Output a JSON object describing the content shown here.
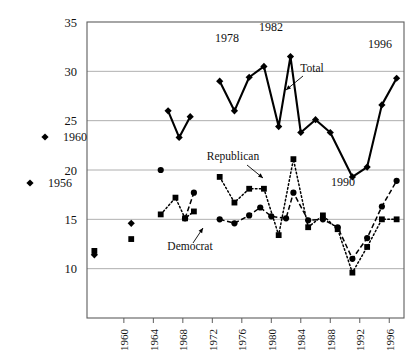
{
  "chart_data": {
    "type": "line",
    "title": "",
    "subtitle": "",
    "xlabel": "",
    "ylabel": "",
    "xlim": [
      1955,
      1998
    ],
    "ylim": [
      5,
      35
    ],
    "yticks": [
      5,
      10,
      15,
      20,
      25,
      30,
      35
    ],
    "ytick_labels": [
      "5",
      "10",
      "15",
      "20",
      "25",
      "30",
      "35"
    ],
    "xticks": [
      1960,
      1964,
      1968,
      1972,
      1976,
      1980,
      1984,
      1988,
      1992,
      1996
    ],
    "xtick_labels": [
      "1960",
      "1964",
      "1968",
      "1972",
      "1976",
      "1980",
      "1984",
      "1988",
      "1992",
      "1996"
    ],
    "grid": "horizontal",
    "legend": "inline-labels",
    "series": [
      {
        "name": "Total",
        "marker": "diamond",
        "linestyle": "solid",
        "points": [
          {
            "x": 1956,
            "y": 11.4
          },
          {
            "x": 1961,
            "y": 14.6
          },
          {
            "x": 1966,
            "y": 26.0
          },
          {
            "x": 1967.5,
            "y": 23.3
          },
          {
            "x": 1969,
            "y": 25.4
          },
          {
            "x": 1973,
            "y": 29.0
          },
          {
            "x": 1975,
            "y": 26.0
          },
          {
            "x": 1977,
            "y": 29.4
          },
          {
            "x": 1979,
            "y": 30.5
          },
          {
            "x": 1981,
            "y": 24.4
          },
          {
            "x": 1982.6,
            "y": 31.5
          },
          {
            "x": 1984,
            "y": 23.8
          },
          {
            "x": 1986,
            "y": 25.1
          },
          {
            "x": 1988,
            "y": 23.8
          },
          {
            "x": 1991,
            "y": 19.3
          },
          {
            "x": 1993,
            "y": 20.3
          },
          {
            "x": 1995,
            "y": 26.6
          },
          {
            "x": 1997,
            "y": 29.3
          }
        ]
      },
      {
        "name": "Republican",
        "marker": "square",
        "linestyle": "dotted",
        "points": [
          {
            "x": 1956,
            "y": 11.8
          },
          {
            "x": 1961,
            "y": 13.0
          },
          {
            "x": 1965,
            "y": 15.5
          },
          {
            "x": 1967,
            "y": 17.2
          },
          {
            "x": 1968.3,
            "y": 15.1
          },
          {
            "x": 1969.5,
            "y": 15.8
          },
          {
            "x": 1973,
            "y": 19.3
          },
          {
            "x": 1975,
            "y": 16.7
          },
          {
            "x": 1977,
            "y": 18.1
          },
          {
            "x": 1979,
            "y": 18.1
          },
          {
            "x": 1981,
            "y": 13.4
          },
          {
            "x": 1983,
            "y": 21.1
          },
          {
            "x": 1985,
            "y": 14.2
          },
          {
            "x": 1987,
            "y": 15.4
          },
          {
            "x": 1989,
            "y": 14.0
          },
          {
            "x": 1991,
            "y": 9.6
          },
          {
            "x": 1993,
            "y": 12.2
          },
          {
            "x": 1995,
            "y": 15.0
          },
          {
            "x": 1997,
            "y": 15.0
          }
        ]
      },
      {
        "name": "Democrat",
        "marker": "circle",
        "linestyle": "dashed",
        "points": [
          {
            "x": 1965,
            "y": 20.0
          },
          {
            "x": 1968.3,
            "y": 15.1
          },
          {
            "x": 1969.5,
            "y": 17.7
          },
          {
            "x": 1973,
            "y": 15.0
          },
          {
            "x": 1975,
            "y": 14.6
          },
          {
            "x": 1977,
            "y": 15.4
          },
          {
            "x": 1978.5,
            "y": 16.2
          },
          {
            "x": 1980,
            "y": 15.3
          },
          {
            "x": 1982,
            "y": 15.1
          },
          {
            "x": 1983,
            "y": 17.7
          },
          {
            "x": 1985,
            "y": 14.9
          },
          {
            "x": 1987,
            "y": 15.0
          },
          {
            "x": 1989,
            "y": 14.2
          },
          {
            "x": 1991,
            "y": 11.0
          },
          {
            "x": 1993,
            "y": 13.1
          },
          {
            "x": 1995,
            "y": 16.3
          },
          {
            "x": 1997,
            "y": 18.9
          }
        ]
      }
    ],
    "annotations": [
      {
        "text": "1956",
        "x": 60,
        "y": 187,
        "marker": "diamond"
      },
      {
        "text": "1960",
        "x": 75,
        "y": 141,
        "marker": "diamond"
      },
      {
        "text": "1978",
        "x": 227,
        "y": 42,
        "marker": "none"
      },
      {
        "text": "1982",
        "x": 271,
        "y": 31,
        "marker": "none"
      },
      {
        "text": "1996",
        "x": 380,
        "y": 48,
        "marker": "none"
      },
      {
        "text": "1990",
        "x": 343,
        "y": 186,
        "marker": "none"
      },
      {
        "text": "Total",
        "x": 312,
        "y": 72,
        "marker": "none"
      },
      {
        "text": "Republican",
        "x": 233,
        "y": 160,
        "marker": "none"
      },
      {
        "text": "Democrat",
        "x": 190,
        "y": 250,
        "marker": "none"
      }
    ]
  }
}
